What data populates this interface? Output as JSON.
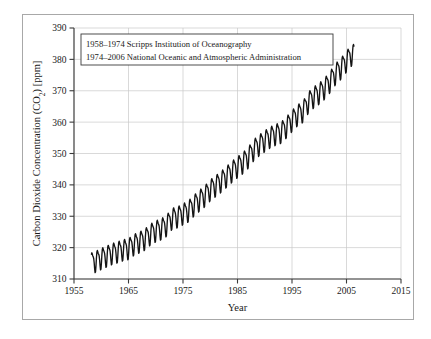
{
  "figure": {
    "background_color": "#ffffff",
    "frame_color": "#a8a8a8"
  },
  "chart_data": {
    "type": "line",
    "title": "",
    "xlabel": "Year",
    "ylabel": "Carbon Dioxide Concentration (CO2) [ppm]",
    "ylabel_parts": {
      "prefix": "Carbon Dioxide Concentration (CO",
      "subscript": "2",
      "suffix": ") [ppm]"
    },
    "xlim": [
      1955,
      2015
    ],
    "ylim": [
      310,
      390
    ],
    "xticks": [
      1955,
      1965,
      1975,
      1985,
      1995,
      2005,
      2015
    ],
    "yticks": [
      310,
      320,
      330,
      340,
      350,
      360,
      370,
      380,
      390
    ],
    "xtick_labels": [
      "1955",
      "1965",
      "1975",
      "1985",
      "1995",
      "2005",
      "2015"
    ],
    "ytick_labels": [
      "310",
      "320",
      "330",
      "340",
      "350",
      "360",
      "370",
      "380",
      "390"
    ],
    "grid": true,
    "grid_color": "#c9c9c9",
    "legend_position": "upper-left-inside",
    "legend_entries": [
      "1958–1974 Scripps Institution of Oceanography",
      "1974–2006 National Oceanic and Atmospheric Administration"
    ],
    "series": [
      {
        "name": "Atmospheric CO2 (monthly mean, Mauna Loa)",
        "color": "#141414",
        "line_width": 1.35,
        "seasonal_amplitude_ppm": 3.1,
        "annual_mean": {
          "x": [
            1958,
            1959,
            1960,
            1961,
            1962,
            1963,
            1964,
            1965,
            1966,
            1967,
            1968,
            1969,
            1970,
            1971,
            1972,
            1973,
            1974,
            1975,
            1976,
            1977,
            1978,
            1979,
            1980,
            1981,
            1982,
            1983,
            1984,
            1985,
            1986,
            1987,
            1988,
            1989,
            1990,
            1991,
            1992,
            1993,
            1994,
            1995,
            1996,
            1997,
            1998,
            1999,
            2000,
            2001,
            2002,
            2003,
            2004,
            2005,
            2006
          ],
          "y": [
            315.3,
            315.98,
            316.91,
            317.64,
            318.45,
            318.99,
            319.62,
            320.04,
            321.38,
            322.16,
            323.04,
            324.62,
            325.68,
            326.32,
            327.45,
            329.68,
            330.18,
            331.11,
            332.04,
            333.83,
            335.4,
            336.84,
            338.75,
            340.11,
            341.45,
            343.05,
            344.65,
            346.12,
            347.42,
            349.19,
            351.57,
            353.12,
            354.39,
            355.61,
            356.45,
            357.1,
            358.83,
            360.82,
            362.61,
            363.73,
            366.7,
            368.38,
            369.55,
            371.14,
            373.28,
            375.8,
            377.52,
            379.8,
            381.9
          ]
        }
      }
    ]
  }
}
